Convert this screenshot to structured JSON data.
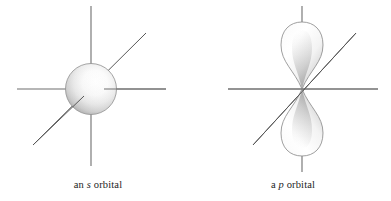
{
  "figure": {
    "background_color": "#ffffff",
    "width": 391,
    "height": 201
  },
  "panels": [
    {
      "id": "s-orbital",
      "caption_prefix": "an ",
      "caption_symbol": "s",
      "caption_suffix": " orbital",
      "caption_full": "an s orbital",
      "shape": "sphere",
      "shape_label": "s-orbital-sphere",
      "center": {
        "x": 91,
        "y": 89
      },
      "radius": 25,
      "fill_highlight_color": "#ffffff",
      "fill_mid_color": "#e3e3e3",
      "fill_edge_color": "#9a9a9a",
      "outline_color": "#8c8c8c",
      "axes": [
        {
          "name": "horizontal-axis",
          "x1": 17,
          "y1": 89,
          "x2": 166,
          "y2": 89,
          "color": "#6e6e6e"
        },
        {
          "name": "vertical-axis",
          "x1": 91,
          "y1": 6,
          "x2": 91,
          "y2": 166,
          "color": "#6e6e6e"
        },
        {
          "name": "diagonal-axis",
          "x1": 33,
          "y1": 145,
          "x2": 146,
          "y2": 33,
          "color": "#555555"
        }
      ]
    },
    {
      "id": "p-orbital",
      "caption_prefix": "a ",
      "caption_symbol": "p",
      "caption_suffix": " orbital",
      "caption_full": "a p orbital",
      "shape": "dumbbell",
      "shape_label": "p-orbital-lobes",
      "center": {
        "x": 107,
        "y": 89
      },
      "lobe_height": 64,
      "lobe_width": 25,
      "fill_highlight_color": "#ffffff",
      "fill_mid_color": "#efefef",
      "fill_edge_color": "#a8a8a8",
      "outline_color": "#8c8c8c",
      "axes": [
        {
          "name": "horizontal-axis",
          "x1": 33,
          "y1": 89,
          "x2": 183,
          "y2": 89,
          "color": "#6e6e6e"
        },
        {
          "name": "vertical-axis-top-stub",
          "x1": 107,
          "y1": 6,
          "x2": 107,
          "y2": 26,
          "color": "#6e6e6e"
        },
        {
          "name": "vertical-axis-bottom-stub",
          "x1": 107,
          "y1": 152,
          "x2": 107,
          "y2": 172,
          "color": "#6e6e6e"
        },
        {
          "name": "diagonal-axis",
          "x1": 58,
          "y1": 145,
          "x2": 161,
          "y2": 33,
          "color": "#555555"
        }
      ]
    }
  ]
}
